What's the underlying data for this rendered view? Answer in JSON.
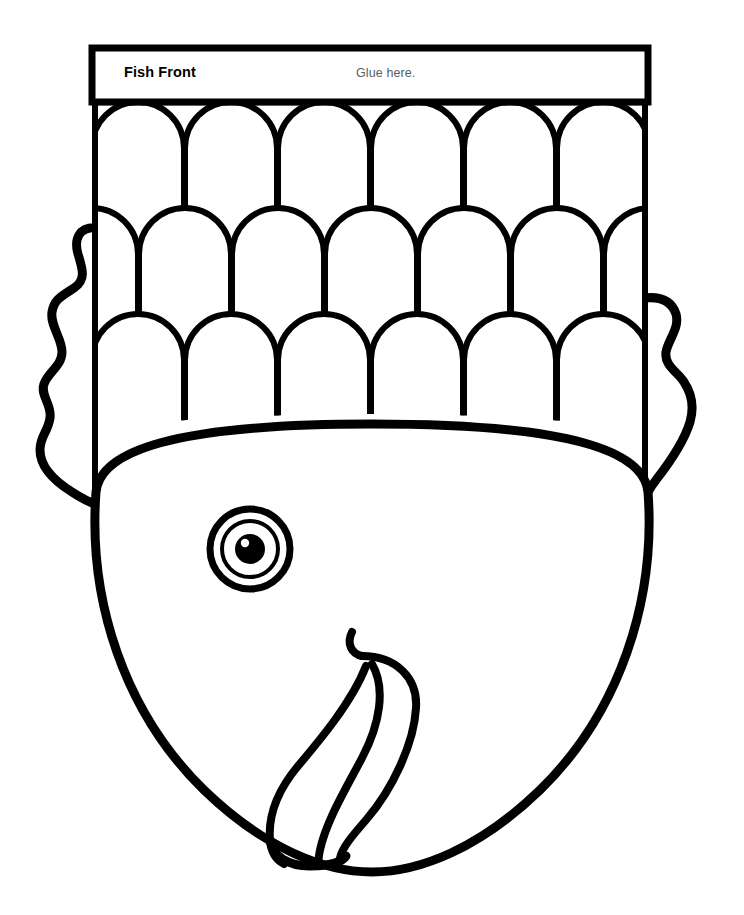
{
  "document": {
    "kind": "printable-craft-template",
    "title": "Fish Front",
    "page_background": "#ffffff",
    "ink_color": "#000000",
    "width": 744,
    "height": 915
  },
  "header": {
    "title": "Fish Front",
    "glue_note": "Glue here.",
    "title_color": "#000000",
    "note_color": "#5c5c5c",
    "box": {
      "x": 92,
      "y": 48,
      "width": 556,
      "height": 54
    }
  },
  "scale_panel": {
    "name": "fish-body-scales",
    "x": 92,
    "y": 102,
    "width": 556,
    "height": 404,
    "rows": 3,
    "row_height": 106,
    "columns_per_row": 6,
    "offset_rows": [
      2
    ],
    "scale_shape": "arch",
    "line_width_outer": 6,
    "line_width_inner": 3
  },
  "fins": {
    "left": {
      "name": "left-fin",
      "edge": "wavy",
      "top_y": 228,
      "bottom_y": 500,
      "outer_x": 38
    },
    "right": {
      "name": "right-fin",
      "edge": "wavy",
      "top_y": 298,
      "bottom_y": 500,
      "outer_x": 700
    }
  },
  "head": {
    "name": "fish-head",
    "top_y": 424,
    "bottom_y": 872,
    "left_x": 88,
    "right_x": 652,
    "outline_width": 9
  },
  "eye": {
    "name": "fish-eye",
    "cx": 250,
    "cy": 549,
    "outer_radius": 42,
    "ring_radius": 30,
    "pupil_radius": 16,
    "highlight": true,
    "color": "#000000"
  },
  "mouth": {
    "name": "fish-lips",
    "curl_top_x": 358,
    "curl_top_y": 634,
    "lobes": 3,
    "bottom_y": 862
  },
  "icons": {
    "scale_icon": "arch-scale-icon",
    "eye_icon": "eye-icon",
    "lips_icon": "lips-icon",
    "fin_icon": "fin-icon"
  }
}
